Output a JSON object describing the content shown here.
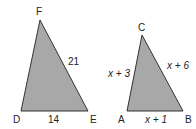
{
  "diagram": {
    "title": "",
    "triangles": [
      {
        "name": "DEF",
        "vertices": {
          "F": [
            40,
            20
          ],
          "D": [
            21,
            111
          ],
          "E": [
            88,
            111
          ]
        },
        "vertex_labels": {
          "F": "F",
          "D": "D",
          "E": "E"
        },
        "side_labels": {
          "FE": "21",
          "DE": "14"
        }
      },
      {
        "name": "ABC",
        "vertices": {
          "C": [
            142,
            35
          ],
          "A": [
            127,
            111
          ],
          "B": [
            183,
            111
          ]
        },
        "vertex_labels": {
          "C": "C",
          "A": "A",
          "B": "B"
        },
        "side_labels": {
          "AC": "x + 3",
          "CB": "x + 6",
          "AB": "x + 1"
        }
      }
    ],
    "colors": {
      "fill": "#a8a8a8",
      "stroke": "#333333",
      "text": "#222222"
    }
  }
}
